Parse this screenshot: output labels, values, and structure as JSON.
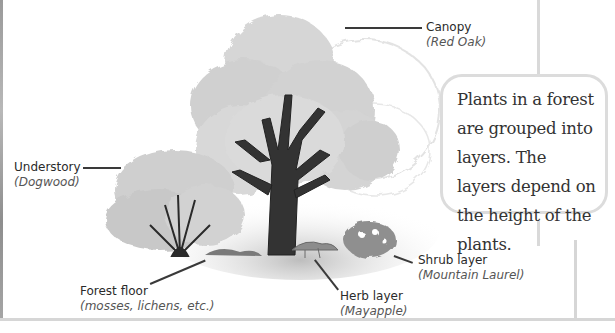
{
  "diagram": {
    "callout": {
      "text": "Plants in a forest are grouped into layers. The layers depend on the height of the plants."
    },
    "labels": [
      {
        "id": "canopy",
        "name": "Canopy",
        "example": "(Red Oak)"
      },
      {
        "id": "understory",
        "name": "Understory",
        "example": "(Dogwood)"
      },
      {
        "id": "forest-floor",
        "name": "Forest floor",
        "example": "(mosses, lichens, etc.)"
      },
      {
        "id": "herb-layer",
        "name": "Herb layer",
        "example": "(Mayapple)"
      },
      {
        "id": "shrub-layer",
        "name": "Shrub layer",
        "example": "(Mountain Laurel)"
      }
    ],
    "colors": {
      "foliage": "#d2d2d2",
      "foliage_dark": "#9a9a9a",
      "trunk": "#2e2e2e",
      "frame": "#d9d9d9",
      "text": "#2a2a2a"
    }
  }
}
